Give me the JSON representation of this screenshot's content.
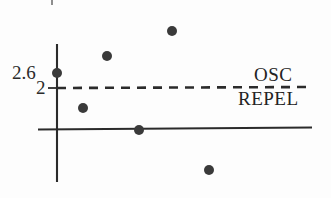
{
  "figure": {
    "background_color": "#fdfdfd",
    "ink_color": "#2b2b2b",
    "point_color": "#3a3a3a"
  },
  "axis_labels": {
    "y_top": "2.6",
    "y_threshold": "2"
  },
  "region_labels": {
    "above": "OSC",
    "below": "REPEL"
  },
  "chart_data": {
    "type": "scatter",
    "title": "",
    "xlabel": "",
    "ylabel": "",
    "grid": false,
    "legend": null,
    "ylim": [
      0,
      4.2
    ],
    "xlim": [
      0,
      10
    ],
    "y_ticks": [
      2.6,
      2
    ],
    "y_tick_labels": [
      "2.6",
      "2"
    ],
    "x_ticks": [],
    "x_tick_labels": [],
    "threshold_line": {
      "y": 2,
      "style": "dashed",
      "label_above": "OSC",
      "label_below": "REPEL",
      "color": "#2b2b2b"
    },
    "baseline": {
      "y": 0,
      "style": "solid",
      "color": "#2b2b2b"
    },
    "points": [
      {
        "x": 0.0,
        "y": 2.6,
        "px": 57,
        "py": 73
      },
      {
        "x": 1.0,
        "y": 1.2,
        "px": 83,
        "py": 108
      },
      {
        "x": 2.0,
        "y": 3.2,
        "px": 107,
        "py": 56
      },
      {
        "x": 3.2,
        "y": 0.0,
        "px": 139,
        "py": 130
      },
      {
        "x": 4.5,
        "y": 3.8,
        "px": 172,
        "py": 31
      },
      {
        "x": 6.0,
        "y": -1.1,
        "px": 209,
        "py": 170
      }
    ],
    "values": [
      2.6,
      1.2,
      3.2,
      0.0,
      3.8,
      -1.1
    ],
    "x": [
      0.0,
      1.0,
      2.0,
      3.2,
      4.5,
      6.0
    ]
  },
  "geometry": {
    "y_axis": {
      "x": 57,
      "y_top": 44,
      "y_bottom": 182
    },
    "x_axis": {
      "y": 129,
      "x_left": 38,
      "x_right": 312
    },
    "dashed_line": {
      "y": 88,
      "x_left": 57,
      "x_right": 312
    },
    "tick_threshold": {
      "x_left": 48,
      "x_right": 57,
      "y": 88
    },
    "point_radius": 5
  }
}
